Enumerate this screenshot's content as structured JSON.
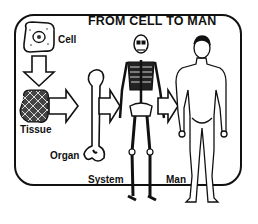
{
  "title": "FROM CELL TO MAN",
  "stages": [
    {
      "label": "Cell",
      "icon": "cell-icon"
    },
    {
      "label": "Tissue",
      "icon": "tissue-icon"
    },
    {
      "label": "Organ",
      "icon": "bone-icon"
    },
    {
      "label": "System",
      "icon": "skeleton-icon"
    },
    {
      "label": "Man",
      "icon": "human-figure-icon"
    }
  ],
  "colors": {
    "ink": "#111111",
    "background": "#ffffff"
  }
}
